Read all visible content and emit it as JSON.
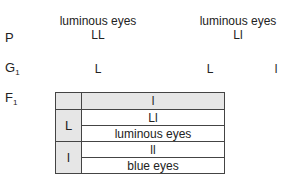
{
  "parents": {
    "label": "P",
    "left": {
      "phenotype": "luminous eyes",
      "genotype": "LL"
    },
    "right": {
      "phenotype": "luminous eyes",
      "genotype": "Ll"
    }
  },
  "gametes": {
    "label": "G",
    "label_sub": "1",
    "left": [
      "L"
    ],
    "right": [
      "L",
      "l"
    ]
  },
  "f1": {
    "label": "F",
    "label_sub": "1",
    "header_col": "l",
    "rows": [
      {
        "gamete": "L",
        "genotype": "Ll",
        "phenotype": "luminous eyes"
      },
      {
        "gamete": "l",
        "genotype": "ll",
        "phenotype": "blue eyes"
      }
    ]
  }
}
